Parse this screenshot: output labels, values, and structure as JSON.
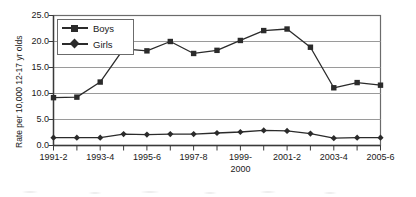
{
  "chart_data": {
    "type": "line",
    "title": "",
    "xlabel": "",
    "ylabel": "Rate per 10,000 12-17 yr olds",
    "ylim": [
      0.0,
      25.0
    ],
    "ytick_labels": [
      "0.0",
      "5.0",
      "10.0",
      "15.0",
      "20.0",
      "25.0"
    ],
    "ytick_values": [
      0.0,
      5.0,
      10.0,
      15.0,
      20.0,
      25.0
    ],
    "grid": true,
    "grid_axis": "y",
    "legend_position": "upper-left-inside",
    "x": [
      "1991-2",
      "1992-3",
      "1993-4",
      "1994-5",
      "1995-6",
      "1996-7",
      "1997-8",
      "1998-9",
      "1999-2000",
      "2000-1",
      "2001-2",
      "2002-3",
      "2003-4",
      "2004-5",
      "2005-6"
    ],
    "xtick_labels": [
      "1991-2",
      "",
      "1993-4",
      "",
      "1995-6",
      "",
      "1997-8",
      "",
      "1999-\n2000",
      "",
      "2001-2",
      "",
      "2003-4",
      "",
      "2005-6"
    ],
    "xtick_labels_visible": [
      "1991-2",
      "1993-4",
      "1995-6",
      "1997-8",
      "1999-",
      "2001-2",
      "2003-4",
      "2005-6"
    ],
    "xtick_label_second_line": "2000",
    "series": [
      {
        "name": "Boys",
        "marker": "square",
        "color": "#2b2b2b",
        "values": [
          9.2,
          9.3,
          12.2,
          18.6,
          18.2,
          20.0,
          17.7,
          18.3,
          20.2,
          22.1,
          22.4,
          18.9,
          11.1,
          12.1,
          11.6
        ]
      },
      {
        "name": "Girls",
        "marker": "diamond",
        "color": "#2b2b2b",
        "values": [
          1.5,
          1.5,
          1.5,
          2.2,
          2.1,
          2.2,
          2.2,
          2.4,
          2.6,
          2.9,
          2.8,
          2.3,
          1.4,
          1.5,
          1.5
        ]
      }
    ]
  },
  "legend": {
    "items": [
      {
        "label": "Boys",
        "marker": "square"
      },
      {
        "label": "Girls",
        "marker": "diamond"
      }
    ]
  },
  "colors": {
    "series": "#2b2b2b",
    "axis": "#3a3a3a",
    "grid": "#9a9a9a",
    "plot_border": "#6b6b6b",
    "background": "#ffffff",
    "text": "#1a1a1a"
  }
}
